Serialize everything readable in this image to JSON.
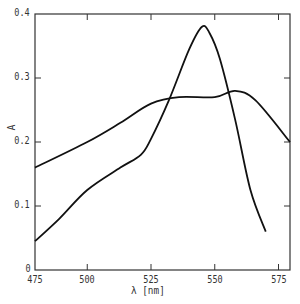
{
  "chart_data": {
    "type": "line",
    "title": "",
    "xlabel": "λ [nm]",
    "ylabel": "A",
    "xlim": [
      475,
      580
    ],
    "ylim": [
      0,
      0.4
    ],
    "x_ticks": [
      475,
      500,
      525,
      550,
      575
    ],
    "x_tick_labels": [
      "475",
      "500",
      "525",
      "550",
      "575"
    ],
    "y_ticks": [
      0,
      0.1,
      0.2,
      0.3,
      0.4
    ],
    "y_tick_labels": [
      "0",
      "0.1",
      "0.2",
      "0.3",
      "0.4"
    ],
    "grid": false,
    "legend": null,
    "series": [
      {
        "name": "broad band",
        "x": [
          479.5,
          500,
          513,
          525,
          536,
          550,
          558,
          566,
          579.5
        ],
        "y": [
          0.16,
          0.2,
          0.23,
          0.26,
          0.27,
          0.27,
          0.28,
          0.265,
          0.2
        ]
      },
      {
        "name": "sharp peak",
        "x": [
          479.5,
          489,
          500,
          513,
          521,
          525,
          532,
          540,
          545,
          548,
          552,
          558,
          564,
          570
        ],
        "y": [
          0.045,
          0.08,
          0.125,
          0.16,
          0.18,
          0.205,
          0.265,
          0.345,
          0.38,
          0.37,
          0.33,
          0.235,
          0.125,
          0.06
        ]
      }
    ]
  },
  "axis": {
    "xlabel": "λ [nm]",
    "ylabel": "A",
    "x_tick_labels": [
      "475",
      "500",
      "525",
      "550",
      "575"
    ],
    "y_tick_labels": [
      "0",
      "0.1",
      "0.2",
      "0.3",
      "0.4"
    ]
  }
}
